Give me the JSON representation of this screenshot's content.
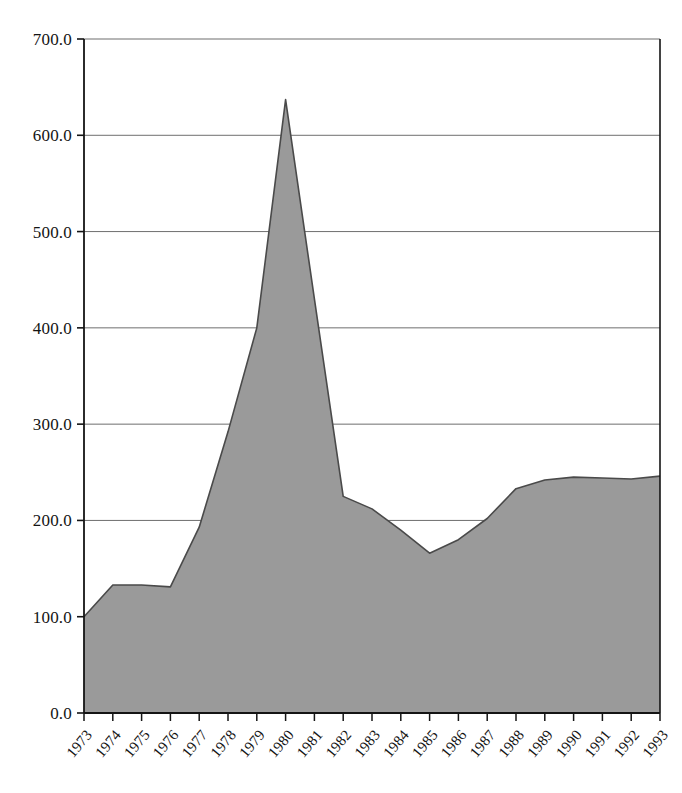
{
  "chart_data": {
    "type": "area",
    "title": "",
    "subtitle": "",
    "xlabel": "",
    "ylabel": "",
    "categories": [
      "1973",
      "1974",
      "1975",
      "1976",
      "1977",
      "1978",
      "1979",
      "1980",
      "1981",
      "1982",
      "1983",
      "1984",
      "1985",
      "1986",
      "1987",
      "1988",
      "1989",
      "1990",
      "1991",
      "1992",
      "1993"
    ],
    "values": [
      100,
      133,
      133,
      131,
      193,
      292,
      400,
      637,
      430,
      225,
      212,
      190,
      166,
      180,
      202,
      233,
      242,
      245,
      244,
      243,
      246
    ],
    "series": [
      {
        "name": "series-1",
        "values": [
          100,
          133,
          133,
          131,
          193,
          292,
          400,
          637,
          430,
          225,
          212,
          190,
          166,
          180,
          202,
          233,
          242,
          245,
          244,
          243,
          246
        ]
      }
    ],
    "ylim": [
      0,
      700
    ],
    "ytick_step": 100,
    "ytick_labels": [
      "0.0",
      "100.0",
      "200.0",
      "300.0",
      "400.0",
      "500.0",
      "600.0",
      "700.0"
    ],
    "ytick_values": [
      0,
      100,
      200,
      300,
      400,
      500,
      600,
      700
    ],
    "grid": true,
    "grid_axis": "y",
    "legend": "none",
    "legend_position": "none",
    "area_fill_color": "#9a9a9a",
    "area_line_color": "#4a4a4a",
    "grid_color": "#6e6e6e",
    "axis_color": "#141414",
    "background_color": "#ffffff",
    "xtick_label_rotation": -50,
    "annotations": []
  },
  "axes": {
    "y_axis_name": "value-axis",
    "x_axis_name": "year-axis"
  }
}
